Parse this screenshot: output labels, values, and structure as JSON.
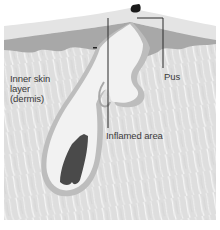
{
  "diagram": {
    "labels": {
      "dermis": "Inner skin\nlayer\n(dermis)",
      "pus": "Pus",
      "inflamed": "Inflamed area"
    },
    "colors": {
      "background": "#ffffff",
      "dermis": "#dcdcdc",
      "dermis_streak": "#f4f4f4",
      "epidermis_outer": "#e2e2e2",
      "epidermis_inner": "#a9a9a9",
      "follicle_wall": "#bdbdbd",
      "follicle_lumen": "#f2f2f2",
      "hair": "#4a4a4a",
      "plug": "#1a1a1a",
      "leader_line": "#2a2a2a"
    }
  }
}
